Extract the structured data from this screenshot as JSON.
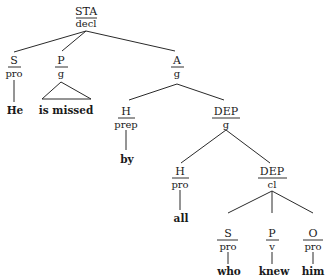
{
  "diagram": {
    "type": "syntax-tree",
    "root": {
      "function": "STA",
      "category": "decl",
      "children": [
        {
          "function": "S",
          "category": "pro",
          "leaf": "He"
        },
        {
          "function": "P",
          "category": "g",
          "leaf": "is missed",
          "triangle": true
        },
        {
          "function": "A",
          "category": "g",
          "children": [
            {
              "function": "H",
              "category": "prep",
              "leaf": "by"
            },
            {
              "function": "DEP",
              "category": "g",
              "children": [
                {
                  "function": "H",
                  "category": "pro",
                  "leaf": "all"
                },
                {
                  "function": "DEP",
                  "category": "cl",
                  "children": [
                    {
                      "function": "S",
                      "category": "pro",
                      "leaf": "who"
                    },
                    {
                      "function": "P",
                      "category": "v",
                      "leaf": "knew"
                    },
                    {
                      "function": "O",
                      "category": "pro",
                      "leaf": "him"
                    }
                  ]
                }
              ]
            }
          ]
        }
      ]
    }
  },
  "nodes": {
    "sta": {
      "fn": "STA",
      "cat": "decl"
    },
    "s1": {
      "fn": "S",
      "cat": "pro",
      "leaf": "He"
    },
    "p1": {
      "fn": "P",
      "cat": "g",
      "leaf": "is missed"
    },
    "a": {
      "fn": "A",
      "cat": "g"
    },
    "h1": {
      "fn": "H",
      "cat": "prep",
      "leaf": "by"
    },
    "dep1": {
      "fn": "DEP",
      "cat": "g"
    },
    "h2": {
      "fn": "H",
      "cat": "pro",
      "leaf": "all"
    },
    "dep2": {
      "fn": "DEP",
      "cat": "cl"
    },
    "s2": {
      "fn": "S",
      "cat": "pro",
      "leaf": "who"
    },
    "p2": {
      "fn": "P",
      "cat": "v",
      "leaf": "knew"
    },
    "o": {
      "fn": "O",
      "cat": "pro",
      "leaf": "him"
    }
  }
}
